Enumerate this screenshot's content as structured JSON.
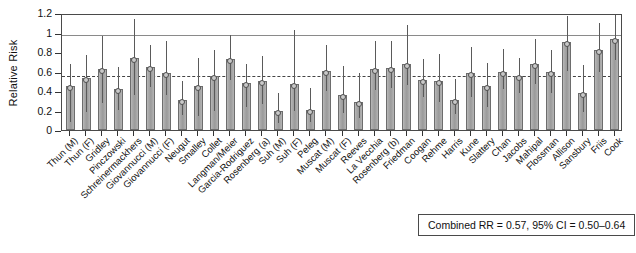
{
  "chart_data": {
    "type": "bar",
    "title": "",
    "xlabel": "",
    "ylabel": "Relative Risk",
    "ylim": [
      0,
      1.2
    ],
    "yticks": [
      0,
      0.2,
      0.4,
      0.6,
      0.8,
      1,
      1.2
    ],
    "ytick_labels": [
      "0",
      "0.2",
      "0.4",
      "0.6",
      "0.8",
      "1",
      "1.2"
    ],
    "grid": false,
    "reference_lines": [
      {
        "value": 1,
        "style": "solid",
        "label": "null effect"
      },
      {
        "value": 0.57,
        "style": "dashed",
        "label": "combined RR"
      }
    ],
    "legend": "none",
    "annotation": "Combined RR = 0.57, 95% CI = 0.50–0.64",
    "categories": [
      "Thun (M)",
      "Thun (F)",
      "Gridley",
      "Pinczowski",
      "Schreinermackhers",
      "Giovannucci (M)",
      "Giovannucci (F)",
      "Neugut",
      "Smalley",
      "Collet",
      "Langman/Meier",
      "Garcia-Rodriguez",
      "Rosenberg (a)",
      "Suh (M)",
      "Suh (F)",
      "Peleg",
      "Muscat (M)",
      "Muscat (F)",
      "Reeves",
      "La Vecchia",
      "Rosenberg (b)",
      "Friedman",
      "Coogan",
      "Rehme",
      "Harris",
      "Kune",
      "Slattery",
      "Chan",
      "Jacobs",
      "Mahipal",
      "Flossman",
      "Allison",
      "Sansbury",
      "Friis",
      "Cook"
    ],
    "values": [
      0.45,
      0.53,
      0.63,
      0.42,
      0.74,
      0.65,
      0.58,
      0.31,
      0.45,
      0.55,
      0.73,
      0.48,
      0.5,
      0.19,
      0.47,
      0.21,
      0.61,
      0.36,
      0.29,
      0.63,
      0.64,
      0.68,
      0.51,
      0.5,
      0.31,
      0.58,
      0.45,
      0.6,
      0.55,
      0.68,
      0.6,
      0.9,
      0.38,
      0.82,
      0.93
    ],
    "ci_low": [
      0.1,
      0.21,
      0.3,
      0.23,
      0.38,
      0.46,
      0.38,
      0.17,
      0.16,
      0.22,
      0.53,
      0.26,
      0.29,
      0.09,
      0.22,
      0.1,
      0.42,
      0.19,
      0.14,
      0.43,
      0.45,
      0.48,
      0.36,
      0.31,
      0.18,
      0.36,
      0.26,
      0.44,
      0.4,
      0.49,
      0.4,
      0.63,
      0.21,
      0.62,
      0.74
    ],
    "ci_high": [
      0.7,
      0.79,
      0.98,
      0.67,
      1.16,
      0.89,
      0.93,
      0.52,
      0.76,
      0.84,
      0.99,
      0.7,
      0.78,
      0.4,
      1.05,
      0.45,
      0.89,
      0.68,
      0.61,
      0.93,
      0.93,
      1.1,
      0.75,
      0.8,
      0.54,
      0.87,
      0.71,
      0.85,
      0.76,
      0.95,
      0.84,
      1.19,
      0.69,
      1.12,
      1.2
    ],
    "ci_high_clipped": [
      false,
      false,
      false,
      false,
      false,
      false,
      false,
      false,
      false,
      false,
      false,
      false,
      false,
      false,
      false,
      false,
      false,
      false,
      false,
      false,
      false,
      false,
      false,
      false,
      false,
      false,
      false,
      false,
      false,
      false,
      false,
      false,
      false,
      false,
      true
    ],
    "ci_low_clipped": [
      true,
      false,
      false,
      false,
      false,
      false,
      false,
      false,
      false,
      false,
      false,
      false,
      false,
      false,
      false,
      false,
      false,
      false,
      false,
      false,
      false,
      false,
      false,
      false,
      false,
      false,
      false,
      false,
      false,
      false,
      false,
      false,
      false,
      false,
      false
    ]
  },
  "annotation_box": {
    "text": "Combined RR = 0.57, 95% CI = 0.50–0.64"
  },
  "axis": {
    "y_title": "Relative Risk"
  },
  "colors": {
    "bar_fill": "#a9a9a9",
    "bar_edge": "#6d6d6d",
    "frame": "#4a4a4a",
    "reference_solid": "#8a8a8a",
    "reference_dashed": "#444444",
    "text": "#111111"
  }
}
